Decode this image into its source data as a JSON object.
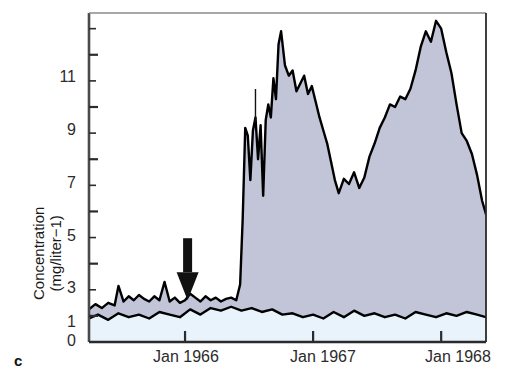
{
  "panel": {
    "label": "c"
  },
  "chart_data": {
    "type": "area",
    "title": "",
    "xlabel": "",
    "ylabel": "Concentration\n(mg/liter−1)",
    "ylabel_line1": "Concentration",
    "ylabel_line2": "(mg/liter−1)",
    "ylim": [
      0,
      12.6
    ],
    "xlim": [
      1965.25,
      1968.35
    ],
    "grid": false,
    "legend_position": "none",
    "ytick_labels": [
      "0",
      "1",
      "3",
      "5",
      "7",
      "9",
      "11"
    ],
    "ytick_values": [
      0,
      1,
      3,
      5,
      7,
      9,
      11
    ],
    "yminor_ticks": [
      2,
      4,
      6,
      8,
      10,
      12
    ],
    "xtick_labels": [
      "Jan 1966",
      "Jan 1967",
      "Jan 1968"
    ],
    "xtick_values": [
      1966.0,
      1967.0,
      1968.0
    ],
    "annotations": [
      {
        "name": "disturbed-watershed-annotation",
        "line1": "losses from disturbed",
        "line2": "watershed plot",
        "leader_to_x": 1966.55,
        "leader_to_y": 8.4
      },
      {
        "name": "deforestation-annotation",
        "line1": "time of",
        "line2": "deforestation",
        "arrow_at_x": 1966.02,
        "arrow_at_y": 1.6
      }
    ],
    "series": [
      {
        "name": "disturbed watershed plot (upper curve)",
        "color": "#000000",
        "fill_color": "#c2c4d7",
        "x": [
          1965.25,
          1965.3,
          1965.35,
          1965.4,
          1965.45,
          1965.48,
          1965.52,
          1965.56,
          1965.6,
          1965.64,
          1965.68,
          1965.72,
          1965.76,
          1965.8,
          1965.84,
          1965.88,
          1965.92,
          1965.96,
          1966.0,
          1966.04,
          1966.08,
          1966.12,
          1966.16,
          1966.2,
          1966.24,
          1966.28,
          1966.32,
          1966.36,
          1966.4,
          1966.43,
          1966.45,
          1966.47,
          1966.49,
          1966.51,
          1966.53,
          1966.55,
          1966.57,
          1966.59,
          1966.61,
          1966.63,
          1966.65,
          1966.67,
          1966.69,
          1966.71,
          1966.73,
          1966.75,
          1966.78,
          1966.81,
          1966.84,
          1966.87,
          1966.9,
          1966.93,
          1966.96,
          1966.99,
          1967.02,
          1967.05,
          1967.08,
          1967.11,
          1967.14,
          1967.17,
          1967.2,
          1967.24,
          1967.28,
          1967.32,
          1967.36,
          1967.4,
          1967.44,
          1967.48,
          1967.52,
          1967.56,
          1967.6,
          1967.64,
          1967.68,
          1967.72,
          1967.76,
          1967.8,
          1967.84,
          1967.88,
          1967.92,
          1967.96,
          1968.0,
          1968.04,
          1968.08,
          1968.12,
          1968.16,
          1968.2,
          1968.24,
          1968.28,
          1968.32,
          1968.35
        ],
        "y": [
          1.25,
          1.45,
          1.3,
          1.5,
          1.4,
          2.15,
          1.55,
          1.75,
          1.6,
          1.8,
          1.65,
          1.55,
          1.75,
          1.6,
          2.3,
          1.55,
          1.7,
          1.5,
          1.6,
          1.85,
          1.7,
          1.55,
          1.75,
          1.6,
          1.7,
          1.55,
          1.65,
          1.7,
          1.6,
          2.2,
          4.7,
          8.2,
          7.9,
          6.2,
          8.1,
          8.6,
          7.0,
          8.3,
          5.6,
          8.5,
          9.1,
          8.6,
          10.1,
          9.3,
          11.4,
          11.9,
          10.6,
          10.2,
          10.4,
          9.6,
          9.9,
          10.2,
          9.5,
          9.8,
          9.2,
          8.6,
          8.1,
          7.6,
          6.9,
          6.2,
          5.7,
          6.25,
          6.05,
          6.5,
          5.9,
          6.3,
          7.1,
          7.6,
          8.2,
          8.6,
          9.1,
          9.0,
          9.4,
          9.3,
          9.7,
          10.4,
          11.3,
          11.9,
          11.5,
          12.3,
          12.0,
          11.1,
          10.3,
          9.1,
          8.0,
          7.7,
          7.2,
          6.4,
          5.4,
          4.9
        ]
      },
      {
        "name": "reference / control (lower curve)",
        "color": "#000000",
        "fill_color": "#e9f3fb",
        "x": [
          1965.25,
          1965.32,
          1965.4,
          1965.48,
          1965.56,
          1965.64,
          1965.72,
          1965.8,
          1965.88,
          1965.96,
          1966.04,
          1966.12,
          1966.2,
          1966.28,
          1966.36,
          1966.44,
          1966.52,
          1966.6,
          1966.68,
          1966.76,
          1966.84,
          1966.92,
          1967.0,
          1967.08,
          1967.16,
          1967.24,
          1967.32,
          1967.4,
          1967.48,
          1967.56,
          1967.64,
          1967.72,
          1967.8,
          1967.88,
          1967.96,
          1968.04,
          1968.12,
          1968.2,
          1968.28,
          1968.35
        ],
        "y": [
          0.9,
          1.05,
          0.85,
          1.1,
          0.95,
          1.05,
          0.9,
          1.15,
          1.05,
          0.95,
          1.25,
          1.05,
          1.3,
          1.2,
          1.35,
          1.2,
          1.3,
          1.15,
          1.25,
          1.05,
          1.1,
          0.95,
          1.05,
          0.9,
          1.15,
          0.95,
          1.2,
          1.0,
          1.1,
          0.95,
          1.05,
          0.9,
          1.15,
          1.05,
          0.95,
          1.1,
          1.0,
          1.15,
          1.05,
          0.95
        ]
      }
    ]
  }
}
